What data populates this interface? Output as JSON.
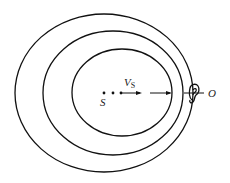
{
  "diagram": {
    "type": "doppler-effect-wavefronts",
    "source_label": "S",
    "velocity_label": "V",
    "velocity_subscript": "S",
    "observer_label": "O",
    "wavefronts": 3,
    "source_dots": 3,
    "colors": {
      "stroke": "#111111",
      "background": "#ffffff"
    }
  }
}
